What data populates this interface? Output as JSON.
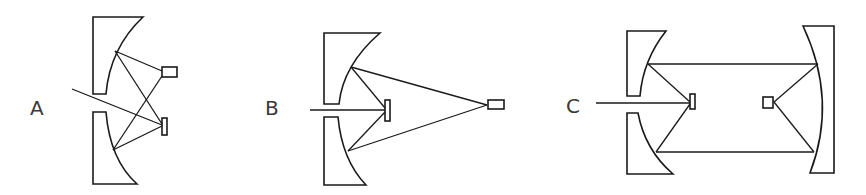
{
  "figure": {
    "colors": {
      "line": "#1a1a1a",
      "label": "#3a3a3a",
      "background": "#ffffff"
    },
    "panels": [
      {
        "id": "A",
        "label": "A",
        "components": [
          "top-concave-mirror",
          "bottom-concave-mirror",
          "grating",
          "detector",
          "input-beam"
        ]
      },
      {
        "id": "B",
        "label": "B",
        "components": [
          "top-concave-mirror",
          "bottom-concave-mirror",
          "grating",
          "detector",
          "input-beam"
        ]
      },
      {
        "id": "C",
        "label": "C",
        "components": [
          "top-left-concave-mirror",
          "bottom-left-concave-mirror",
          "grating",
          "right-concave-mirror",
          "detector",
          "input-beam"
        ]
      }
    ]
  }
}
